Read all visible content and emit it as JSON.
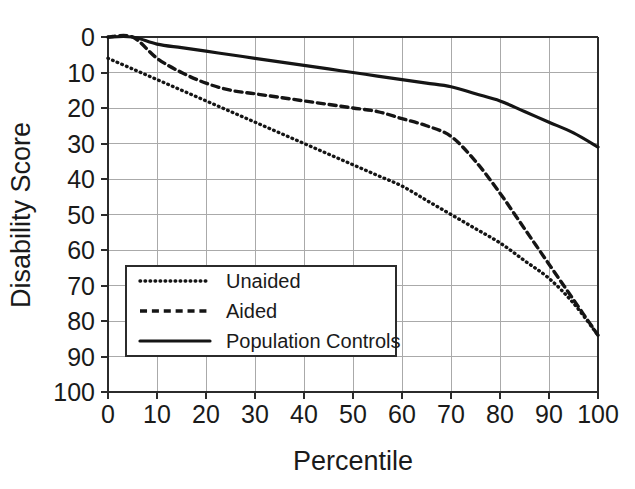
{
  "chart_data": {
    "type": "line",
    "title": "",
    "xlabel": "Percentile",
    "ylabel": "Disability Score",
    "xlim": [
      0,
      100
    ],
    "ylim": [
      0,
      100
    ],
    "y_inverted": true,
    "grid": true,
    "legend_position": "bottom-left-inside",
    "x_ticks": [
      0,
      10,
      20,
      30,
      40,
      50,
      60,
      70,
      80,
      90,
      100
    ],
    "x_tick_labels": [
      "0",
      "10",
      "20",
      "30",
      "40",
      "50",
      "60",
      "70",
      "80",
      "90",
      "100"
    ],
    "y_ticks": [
      0,
      10,
      20,
      30,
      40,
      50,
      60,
      70,
      80,
      90,
      100
    ],
    "y_tick_labels": [
      "0",
      "10",
      "20",
      "30",
      "40",
      "50",
      "60",
      "70",
      "80",
      "90",
      "100"
    ],
    "x": [
      0,
      5,
      10,
      15,
      20,
      25,
      30,
      35,
      40,
      45,
      50,
      55,
      60,
      65,
      70,
      75,
      80,
      85,
      90,
      95,
      100
    ],
    "series": [
      {
        "name": "Unaided",
        "style": "dotted",
        "color": "#151515",
        "values": [
          6,
          9,
          12,
          15,
          18,
          21,
          24,
          27,
          30,
          33,
          36,
          39,
          42,
          46,
          50,
          54,
          58,
          63,
          68,
          75,
          84
        ]
      },
      {
        "name": "Aided",
        "style": "dashed",
        "color": "#151515",
        "values": [
          0,
          0,
          6,
          10,
          13,
          15,
          16,
          17,
          18,
          19,
          20,
          21,
          23,
          25,
          28,
          35,
          44,
          54,
          64,
          74,
          84
        ]
      },
      {
        "name": "Population Controls",
        "style": "solid",
        "color": "#151515",
        "values": [
          0,
          0,
          2,
          3,
          4,
          5,
          6,
          7,
          8,
          9,
          10,
          11,
          12,
          13,
          14,
          16,
          18,
          21,
          24,
          27,
          31
        ]
      }
    ]
  },
  "legend": {
    "entries": [
      {
        "label": "Unaided",
        "style": "dotted"
      },
      {
        "label": "Aided",
        "style": "dashed"
      },
      {
        "label": "Population Controls",
        "style": "solid"
      }
    ]
  },
  "geometry": {
    "plot_left": 108,
    "plot_right": 598,
    "plot_top": 37,
    "plot_bottom": 392,
    "legend_x": 126,
    "legend_y": 266,
    "legend_w": 270,
    "legend_h": 90
  }
}
